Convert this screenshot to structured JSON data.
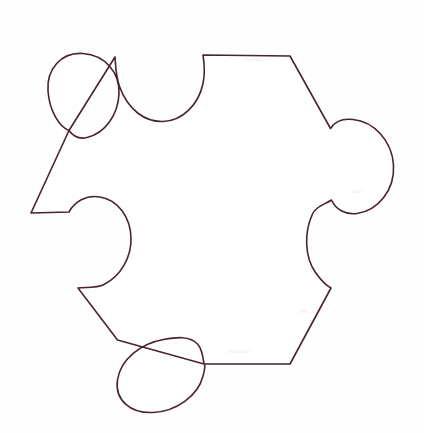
{
  "image": {
    "title": "Puzzle Piece Outline",
    "kind": "line-drawing",
    "description": "Hand-drawn single jigsaw puzzle piece outline on white paper",
    "width": 424,
    "height": 433,
    "background_color": "#fefefe",
    "paper_color": "#ffffff",
    "stroke_color": "#4a2230",
    "stroke_width": 1.6,
    "fill_color": "#ffffff"
  },
  "shape": {
    "name": "jigsaw-puzzle-piece",
    "sides": 6,
    "tab_count": 3,
    "blank_count": 3,
    "features": [
      {
        "name": "top-blank",
        "type": "blank",
        "position": "top-center",
        "center_x": 159,
        "center_y": 58,
        "radius": 45
      },
      {
        "name": "top-right-edge",
        "type": "straight-edge",
        "from_x": 203,
        "from_y": 55,
        "to_x": 290,
        "to_y": 56
      },
      {
        "name": "upper-right-diagonal",
        "type": "straight-edge",
        "from_x": 290,
        "from_y": 56,
        "to_x": 330,
        "to_y": 128
      },
      {
        "name": "right-tab",
        "type": "tab",
        "position": "right-upper",
        "center_x": 356,
        "center_y": 168,
        "radius": 45
      },
      {
        "name": "right-blank",
        "type": "blank",
        "position": "right-lower",
        "center_x": 350,
        "center_y": 247,
        "radius": 44
      },
      {
        "name": "lower-right-diagonal",
        "type": "straight-edge",
        "from_x": 331,
        "from_y": 288,
        "to_x": 290,
        "to_y": 364
      },
      {
        "name": "bottom-edge",
        "type": "straight-edge",
        "from_x": 290,
        "from_y": 364,
        "to_x": 204,
        "to_y": 364
      },
      {
        "name": "bottom-left-tab",
        "type": "tab",
        "position": "bottom-left",
        "center_x": 160,
        "center_y": 368,
        "radius": 44
      },
      {
        "name": "lower-left-diagonal",
        "type": "straight-edge",
        "from_x": 117,
        "from_y": 340,
        "to_x": 78,
        "to_y": 288
      },
      {
        "name": "left-lower-diagonal",
        "type": "straight-edge",
        "from_x": 78,
        "from_y": 288,
        "to_x": 31,
        "to_y": 213
      },
      {
        "name": "left-upper-diagonal",
        "type": "straight-edge",
        "from_x": 31,
        "from_y": 213,
        "to_x": 69,
        "to_y": 130
      },
      {
        "name": "upper-left-tab",
        "type": "tab",
        "position": "top-left",
        "center_x": 87,
        "center_y": 94,
        "radius": 44
      }
    ],
    "path": "M 203 55 L 290 56 L 330 128 C 336 118 348 120 360 122 C 382 126 396 146 395 168 C 394 190 380 209 358 213 C 344 215 334 208 331 199 C 323 206 313 207 311 219 C 306 238 308 262 319 276 C 325 283 331 288 331 288 L 290 364 L 204 364 C 204 364 204 352 199 346 C 190 336 174 340 162 341 C 140 343 120 356 117 378 C 114 398 130 412 152 412 C 174 412 196 400 202 380 C 206 366 204 364 204 364 L 117 340 L 78 288 C 86 286 96 288 104 284 C 120 276 130 258 130 240 C 130 218 118 202 100 198 C 86 195 76 202 69 212 L 31 213 L 69 130 C 72 136 78 140 86 138 C 104 134 116 116 118 96 C 120 74 106 56 84 54 C 62 52 47 68 48 90 C 49 110 60 126 69 130 L 115 57 C 115 57 115 74 120 86 C 130 108 146 120 162 120 C 180 120 196 106 202 84 C 205 70 203 55 203 55 Z"
  },
  "geometry_notes": {
    "left_vertex": {
      "x": 31,
      "y": 213
    },
    "top_left_notch_start": {
      "x": 115,
      "y": 57
    },
    "top_edge_start": {
      "x": 203,
      "y": 55
    },
    "top_edge_end": {
      "x": 290,
      "y": 56
    },
    "right_tab_apex_x": 395,
    "bottom_edge_y": 364,
    "bottom_tab_apex_y": 412
  }
}
